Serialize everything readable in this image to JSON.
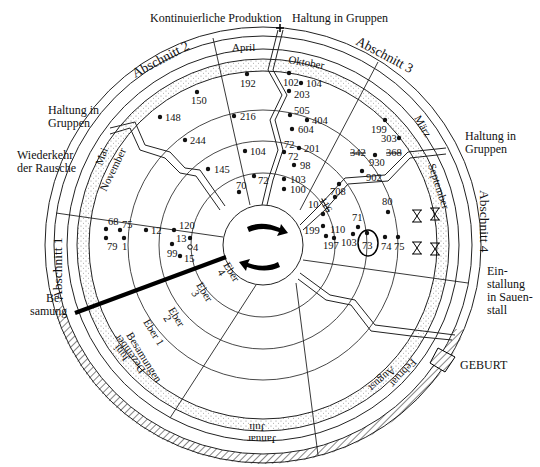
{
  "outer_labels": {
    "top_center": "Kontinuierliche Produktion",
    "top_right": "Haltung in Gruppen",
    "left_upper": "Haltung in Gruppen",
    "left_upper_line1": "Haltung in",
    "left_upper_line2": "Gruppen",
    "right_upper_line1": "Haltung in",
    "right_upper_line2": "Gruppen",
    "wiederkehr_line1": "Wiederkehr",
    "wiederkehr_line2": "der Rausche",
    "besamung_line1": "Be-",
    "besamung_line2": "samung",
    "einstallung_line1": "Ein-",
    "einstallung_line2": "stallung",
    "einstallung_line3": "in Sauen-",
    "einstallung_line4": "stall",
    "geburt": "GEBURT"
  },
  "sections": {
    "abschnitt1": "Abschnitt 1",
    "abschnitt2": "Abschnitt 2",
    "abschnitt3": "Abschnitt 3",
    "abschnitt4": "Abschnitt 4"
  },
  "months": {
    "april": "April",
    "oktober": "Oktober",
    "maerz": "März",
    "september": "September",
    "mai": "Mai",
    "november": "November",
    "juni": "Juni",
    "dezember": "Dezember",
    "juli": "Juli",
    "januar": "Januar",
    "august": "August",
    "februar": "Februar"
  },
  "inner_labels": {
    "besamungen": "Besamungen",
    "eber1": "Eber 1",
    "eber2_a": "Eber",
    "eber2_b": "2",
    "eber3_a": "Eber",
    "eber3_b": "3",
    "eber4_a": "Eber",
    "eber4_b": "4"
  },
  "sow_numbers": {
    "n192": "192",
    "n150": "150",
    "n148": "148",
    "n216": "216",
    "n244": "244",
    "n104a": "104",
    "n145": "145",
    "n70": "70",
    "n72a": "72",
    "n102": "102",
    "n104b": "104",
    "n203": "203",
    "n505": "505",
    "n404": "404",
    "n604": "604",
    "n72b": "72",
    "n72c": "72",
    "n201": "201",
    "n98": "98",
    "n103a": "103",
    "n100": "100",
    "n199a": "199",
    "n303": "303",
    "n342": "342",
    "n368": "368",
    "n930": "930",
    "n902": "902",
    "n708": "708",
    "n10": "10",
    "n116": "116",
    "n199b": "199",
    "n110": "110",
    "n197": "197",
    "n71": "71",
    "n103b": "103",
    "n73": "73",
    "n74": "74",
    "n75b": "75",
    "n80": "80",
    "n68": "68",
    "n75a": "75",
    "n79": "79",
    "n1": "1",
    "n12": "12",
    "n120": "120",
    "n13": "13",
    "n4": "4",
    "n99": "99",
    "n15": "15"
  },
  "colors": {
    "ink": "#111111",
    "background": "#ffffff",
    "stipple": "#9a9a9a"
  }
}
